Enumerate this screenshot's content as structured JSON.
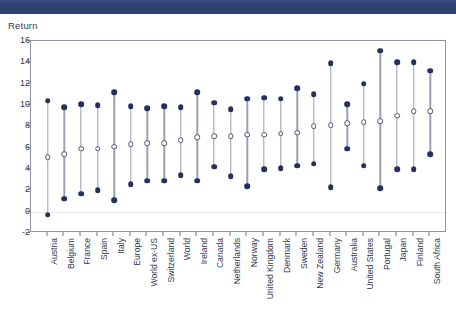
{
  "header": {
    "bar_color": "#2e4272"
  },
  "chart": {
    "y_axis_title": "Return",
    "accent_color": "#23315e",
    "stem_color": "#9aa0b4",
    "frame_color": "#8d93a8"
  },
  "chart_data": {
    "type": "scatter",
    "title": "",
    "subtitle": "",
    "xlabel": "",
    "ylabel": "Return",
    "ylim": [
      -2,
      16
    ],
    "yticks": [
      -2,
      0,
      2,
      4,
      6,
      8,
      10,
      12,
      14,
      16
    ],
    "grid": true,
    "gridlines_at": [
      0
    ],
    "legend": [],
    "categories": [
      "Austria",
      "Belgium",
      "France",
      "Spain",
      "Italy",
      "Europe",
      "World ex-US",
      "Switzerland",
      "World",
      "Ireland",
      "Canada",
      "Netherlands",
      "Norway",
      "United Kingdom",
      "Denmark",
      "Sweden",
      "New Zealand",
      "Germany",
      "Australia",
      "United States",
      "Portugal",
      "Japan",
      "Finland",
      "South Africa"
    ],
    "series": [
      {
        "name": "High",
        "marker": "filled-circle",
        "values": [
          10.4,
          9.8,
          10.1,
          10.0,
          11.2,
          9.9,
          9.7,
          9.9,
          9.8,
          11.2,
          10.2,
          9.6,
          10.6,
          10.7,
          10.6,
          11.6,
          11.0,
          13.9,
          10.1,
          12.0,
          15.1,
          14.0,
          14.0,
          13.2
        ]
      },
      {
        "name": "Mean",
        "marker": "open-circle",
        "values": [
          5.1,
          5.4,
          5.9,
          5.9,
          6.1,
          6.3,
          6.4,
          6.4,
          6.7,
          7.0,
          7.1,
          7.1,
          7.2,
          7.2,
          7.3,
          7.4,
          8.0,
          8.1,
          8.3,
          8.4,
          8.5,
          9.0,
          9.4,
          9.4
        ]
      },
      {
        "name": "Low",
        "marker": "filled-circle",
        "values": [
          -0.3,
          1.2,
          1.7,
          2.0,
          1.1,
          2.6,
          2.9,
          2.9,
          3.4,
          2.9,
          4.2,
          3.3,
          2.4,
          4.0,
          4.1,
          4.3,
          4.5,
          2.3,
          5.9,
          4.3,
          2.2,
          4.0,
          4.0,
          5.4
        ]
      }
    ]
  }
}
